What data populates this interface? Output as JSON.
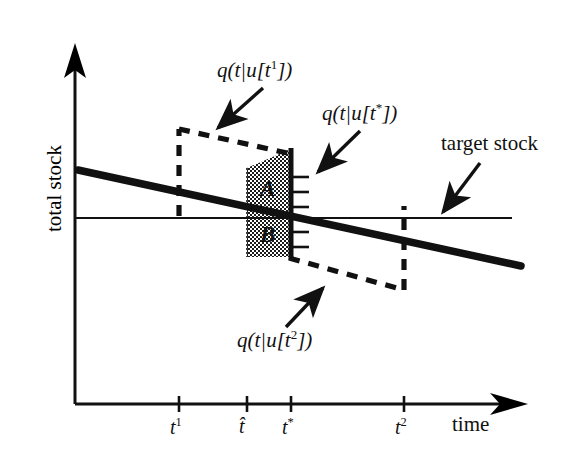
{
  "figure": {
    "kind": "economics-schematic",
    "background_color": "#ffffff",
    "ink_color": "#111111"
  },
  "axes": {
    "y_label": "total stock",
    "x_label": "time",
    "x_ticks": [
      {
        "id": "t1",
        "label_base": "t",
        "label_sup": "1",
        "hat": false,
        "star": false,
        "x": 179
      },
      {
        "id": "that",
        "label_base": "t",
        "label_sup": "",
        "hat": true,
        "star": false,
        "x": 247
      },
      {
        "id": "tstar",
        "label_base": "t",
        "label_sup": "",
        "hat": false,
        "star": true,
        "x": 291
      },
      {
        "id": "t2",
        "label_base": "t",
        "label_sup": "2",
        "hat": false,
        "star": false,
        "x": 404
      }
    ],
    "y_axis_x": 75,
    "x_axis_y": 404,
    "origin_label": ""
  },
  "annotations": {
    "q_t1": {
      "text": "q(t|u[t¹])",
      "head": "q(t|u[t",
      "sup": "1",
      "tail": "])"
    },
    "q_tstar": {
      "text": "q(t|u[t*])",
      "head": "q(t|u[t",
      "sup": "*",
      "tail": "])"
    },
    "q_t2": {
      "text": "q(t|u[t²])",
      "head": "q(t|u[t",
      "sup": "2",
      "tail": "])"
    },
    "target": {
      "text": "target stock"
    }
  },
  "regions": {
    "A": {
      "label": "A",
      "position": "above-target-line",
      "fill": "stipple"
    },
    "B": {
      "label": "B",
      "position": "below-target-line",
      "fill": "stipple"
    }
  },
  "curves": {
    "baseline": {
      "style": "solid-thick",
      "description": "q(t|u[t*]) declining stock path"
    },
    "upper_dash": {
      "style": "dashed",
      "description": "q(t|u[t¹]) path after jump at t¹"
    },
    "lower_dash": {
      "style": "dashed",
      "description": "q(t|u[t²]) path dropping to t²"
    },
    "target_line": {
      "style": "solid-thin",
      "description": "target stock level"
    }
  }
}
